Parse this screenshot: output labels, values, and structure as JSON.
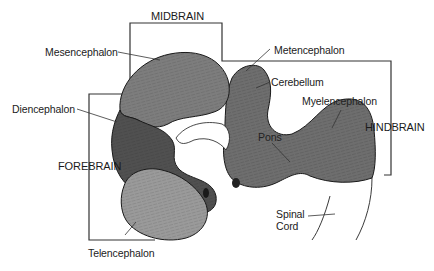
{
  "diagram": {
    "regions": {
      "midbrain": "MIDBRAIN",
      "hindbrain": "HINDBRAIN",
      "forebrain": "FOREBRAIN"
    },
    "structures": {
      "mesencephalon": "Mesencephalon",
      "diencephalon": "Diencephalon",
      "telencephalon": "Telencephalon",
      "metencephalon": "Metencephalon",
      "cerebellum": "Cerebellum",
      "myelencephalon": "Myelencephalon",
      "pons": "Pons",
      "spinal_cord_line1": "Spinal",
      "spinal_cord_line2": "Cord"
    },
    "colors": {
      "mesencephalon": "#7d7d7d",
      "diencephalon": "#505050",
      "telencephalon": "#9a9a9a",
      "hindbrain": "#6e6e6e",
      "outline": "#1a1a1a",
      "bracket": "#333333"
    }
  }
}
